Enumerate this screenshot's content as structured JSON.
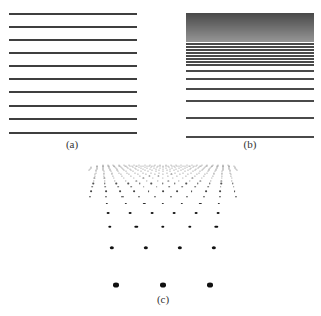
{
  "figure": {
    "panels": [
      {
        "id": "a",
        "label": "(a)",
        "label_pos": [
          72,
          138
        ],
        "description": "evenly spaced horizontal lines",
        "x_range": [
          9,
          137
        ],
        "line_y": [
          13,
          26,
          39,
          52,
          65,
          78,
          91,
          105,
          118,
          132
        ]
      },
      {
        "id": "b",
        "label": "(b)",
        "label_pos": [
          250,
          138
        ],
        "description": "horizontal lines converging toward top (perspective texture gradient)",
        "x_range": [
          186,
          314
        ],
        "dense_band": [
          13,
          41
        ],
        "line_y": [
          43,
          46,
          49,
          52,
          55,
          58,
          61,
          64,
          70,
          78,
          88,
          100,
          117,
          136
        ]
      },
      {
        "id": "c",
        "label": "(c)",
        "label_pos": [
          163,
          293
        ],
        "description": "perspective grid of dots receding toward the horizon",
        "horizon_y": 150,
        "vanishing_x": 163,
        "rows": 22,
        "cols": 9,
        "near_y": 285,
        "near_spacing": 47,
        "near_dot_size": 6
      }
    ]
  }
}
